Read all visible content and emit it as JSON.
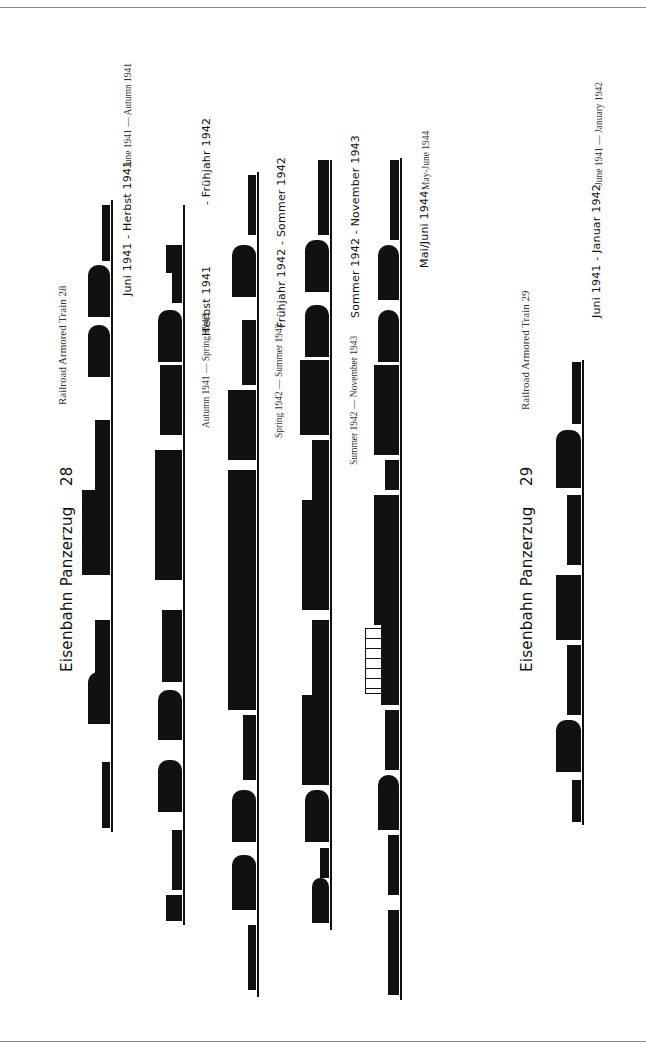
{
  "train28": {
    "title": "Eisenbahn Panzerzug",
    "number": "28",
    "subtitle_en": "Railroad Armored Train 28",
    "configs": [
      {
        "period_de": "Juni 1941 - Herbst 1941",
        "period_en": "June 1941 — Autumn 1941"
      },
      {
        "period_de": "Herbst 1941",
        "period_de_end": "- Frühjahr 1942",
        "period_en": "Autumn 1941 — Spring 1942"
      },
      {
        "period_de": "Frühjahr 1942 - Sommer 1942",
        "period_en": "Spring 1942 — Summer 1942"
      },
      {
        "period_de": "Sommer 1942 - November 1943",
        "period_en": "Summer 1942 — November 1943"
      },
      {
        "period_de": "Mai/Juni 1944",
        "period_en": "May-June 1944"
      }
    ]
  },
  "train29": {
    "title": "Eisenbahn Panzerzug",
    "number": "29",
    "subtitle_en": "Railroad Armored Train 29",
    "configs": [
      {
        "period_de": "Juni 1941 - Januar 1942",
        "period_en": "June 1941 — January 1942"
      }
    ]
  },
  "colors": {
    "ink": "#111111",
    "rule": "#8a8a8a",
    "paper": "#ffffff"
  }
}
